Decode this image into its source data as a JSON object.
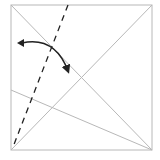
{
  "diagram": {
    "type": "origami-fold-step",
    "colors": {
      "crease_line": "#b8b8b8",
      "valley_fold": "#222222",
      "arrow": "#222222",
      "background": "#ffffff"
    },
    "square": {
      "x1": 11,
      "y1": 5,
      "x2": 152,
      "y2": 150
    },
    "creases": [
      {
        "name": "diagonal-tl-br",
        "x1": 11,
        "y1": 5,
        "x2": 152,
        "y2": 150
      },
      {
        "name": "diagonal-bl-tr",
        "x1": 11,
        "y1": 150,
        "x2": 152,
        "y2": 5
      },
      {
        "name": "left-edge-to-corner",
        "x1": 11,
        "y1": 90,
        "x2": 152,
        "y2": 150
      }
    ],
    "valley_fold_line": {
      "x1": 68,
      "y1": 5,
      "x2": 14,
      "y2": 145
    },
    "fold_arrow": {
      "from": [
        20,
        43
      ],
      "control": [
        55,
        38
      ],
      "to": [
        68,
        73
      ]
    }
  }
}
